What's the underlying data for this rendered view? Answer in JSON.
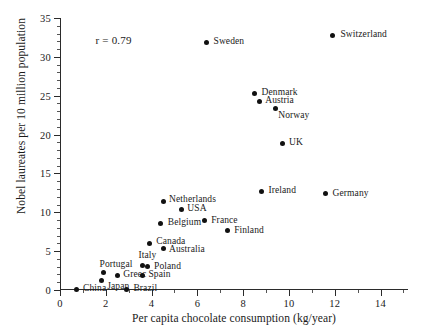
{
  "chart_data": {
    "type": "scatter",
    "title": "",
    "xlabel": "Per capita chocolate consumption (kg/year)",
    "ylabel": "Nobel laureates per 10 million population",
    "xlim": [
      0,
      15.2
    ],
    "ylim": [
      0,
      35
    ],
    "xticks": [
      0,
      2,
      4,
      6,
      8,
      10,
      12,
      14
    ],
    "yticks": [
      0,
      5,
      10,
      15,
      20,
      25,
      30,
      35
    ],
    "xtick_labels": [
      "0",
      "2",
      "4",
      "6",
      "8",
      "10",
      "12",
      "14"
    ],
    "ytick_labels": [
      "0",
      "5",
      "10",
      "15",
      "20",
      "25",
      "30",
      "35"
    ],
    "grid": false,
    "legend": false,
    "annotations": [
      {
        "text": "r = 0.79",
        "x": 1.55,
        "y": 32.0
      }
    ],
    "points": [
      {
        "label": "China",
        "x": 0.7,
        "y": 0.1,
        "label_dx": 7,
        "label_dy": 0
      },
      {
        "label": "Brazil",
        "x": 2.9,
        "y": 0.1,
        "label_dx": 7,
        "label_dy": 0
      },
      {
        "label": "Japan",
        "x": 1.8,
        "y": 1.2,
        "label_dx": 6,
        "label_dy": 6
      },
      {
        "label": "Greec",
        "x": 2.5,
        "y": 1.9,
        "label_dx": 6,
        "label_dy": 0
      },
      {
        "label": "Portugal",
        "x": 1.9,
        "y": 2.2,
        "label_dx": -4,
        "label_dy": -8
      },
      {
        "label": "Spain",
        "x": 3.6,
        "y": 1.9,
        "label_dx": 6,
        "label_dy": 0
      },
      {
        "label": "Italy",
        "x": 3.6,
        "y": 3.2,
        "label_dx": -4,
        "label_dy": -9
      },
      {
        "label": "Poland",
        "x": 3.8,
        "y": 3.0,
        "label_dx": 7,
        "label_dy": 0
      },
      {
        "label": "Australia",
        "x": 4.5,
        "y": 5.3,
        "label_dx": 6,
        "label_dy": 1
      },
      {
        "label": "Canada",
        "x": 3.9,
        "y": 6.0,
        "label_dx": 7,
        "label_dy": -1
      },
      {
        "label": "Belgium",
        "x": 4.4,
        "y": 8.6,
        "label_dx": 7,
        "label_dy": 0
      },
      {
        "label": "USA",
        "x": 5.3,
        "y": 10.4,
        "label_dx": 6,
        "label_dy": 0
      },
      {
        "label": "Netherlands",
        "x": 4.5,
        "y": 11.4,
        "label_dx": 6,
        "label_dy": -1
      },
      {
        "label": "France",
        "x": 6.3,
        "y": 8.9,
        "label_dx": 7,
        "label_dy": 0
      },
      {
        "label": "Finland",
        "x": 7.3,
        "y": 7.6,
        "label_dx": 7,
        "label_dy": 0
      },
      {
        "label": "Ireland",
        "x": 8.8,
        "y": 12.7,
        "label_dx": 7,
        "label_dy": 0
      },
      {
        "label": "Germany",
        "x": 11.6,
        "y": 12.4,
        "label_dx": 7,
        "label_dy": 0
      },
      {
        "label": "UK",
        "x": 9.7,
        "y": 18.9,
        "label_dx": 7,
        "label_dy": 0
      },
      {
        "label": "Norway",
        "x": 9.4,
        "y": 23.3,
        "label_dx": 3,
        "label_dy": 7
      },
      {
        "label": "Austria",
        "x": 8.7,
        "y": 24.3,
        "label_dx": 6,
        "label_dy": 0
      },
      {
        "label": "Denmark",
        "x": 8.5,
        "y": 25.3,
        "label_dx": 7,
        "label_dy": 0
      },
      {
        "label": "Sweden",
        "x": 6.4,
        "y": 31.9,
        "label_dx": 7,
        "label_dy": 0
      },
      {
        "label": "Switzerland",
        "x": 11.9,
        "y": 32.8,
        "label_dx": 8,
        "label_dy": 0
      }
    ]
  }
}
